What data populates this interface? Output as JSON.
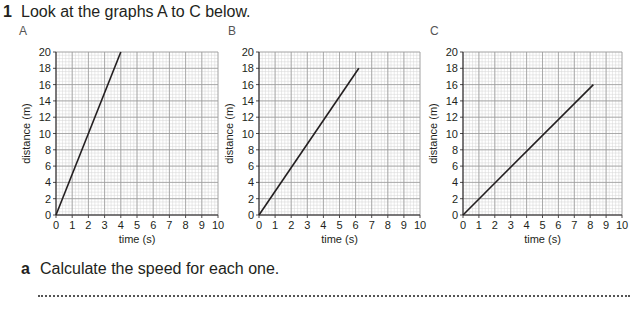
{
  "question": {
    "number": "1",
    "text": "Look at the graphs A to C below."
  },
  "subquestion": {
    "letter": "a",
    "text": "Calculate the speed for each one."
  },
  "colors": {
    "line": "#231f20",
    "major_grid": "#9a9a9a",
    "minor_grid": "#d4d4d4",
    "axis": "#231f20"
  },
  "chart_data": [
    {
      "type": "line",
      "title": "A",
      "xlabel": "time (s)",
      "ylabel": "distance (m)",
      "xlim": [
        0,
        10
      ],
      "ylim": [
        0,
        20
      ],
      "x_ticks": [
        0,
        1,
        2,
        3,
        4,
        5,
        6,
        7,
        8,
        9,
        10
      ],
      "y_ticks": [
        0,
        2,
        4,
        6,
        8,
        10,
        12,
        14,
        16,
        18,
        20
      ],
      "grid": true,
      "series": [
        {
          "name": "A",
          "x": [
            0,
            4
          ],
          "y": [
            0,
            20
          ]
        }
      ]
    },
    {
      "type": "line",
      "title": "B",
      "xlabel": "time (s)",
      "ylabel": "distance (m)",
      "xlim": [
        0,
        10
      ],
      "ylim": [
        0,
        20
      ],
      "x_ticks": [
        0,
        1,
        2,
        3,
        4,
        5,
        6,
        7,
        8,
        9,
        10
      ],
      "y_ticks": [
        0,
        2,
        4,
        6,
        8,
        10,
        12,
        14,
        16,
        18,
        20
      ],
      "grid": true,
      "series": [
        {
          "name": "B",
          "x": [
            0,
            6.2
          ],
          "y": [
            0,
            18
          ]
        }
      ]
    },
    {
      "type": "line",
      "title": "C",
      "xlabel": "time (s)",
      "ylabel": "distance (m)",
      "xlim": [
        0,
        10
      ],
      "ylim": [
        0,
        20
      ],
      "x_ticks": [
        0,
        1,
        2,
        3,
        4,
        5,
        6,
        7,
        8,
        9,
        10
      ],
      "y_ticks": [
        0,
        2,
        4,
        6,
        8,
        10,
        12,
        14,
        16,
        18,
        20
      ],
      "grid": true,
      "series": [
        {
          "name": "C",
          "x": [
            0,
            8.2
          ],
          "y": [
            0,
            16
          ]
        }
      ]
    }
  ]
}
